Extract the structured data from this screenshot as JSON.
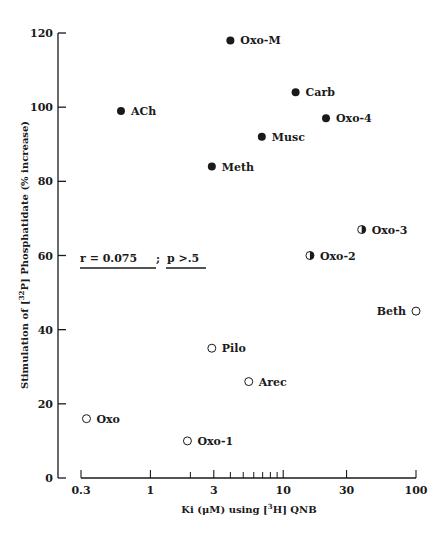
{
  "chart_data": {
    "type": "scatter",
    "title": "",
    "xlabel": "Ki (μM) using [3H] QNB",
    "ylabel": "Stimulation of [32P] Phosphatidate (% increase)",
    "x_scale": "log",
    "xlim": [
      0.3,
      100
    ],
    "ylim": [
      0,
      120
    ],
    "x_ticks": [
      0.3,
      1,
      3,
      10,
      30,
      100
    ],
    "x_tick_labels": [
      "0.3",
      "1",
      "3",
      "10",
      "30",
      "100"
    ],
    "x_minor_ticks": [
      2,
      4,
      5,
      6,
      7,
      8,
      9
    ],
    "y_ticks": [
      0,
      20,
      40,
      60,
      80,
      100,
      120
    ],
    "y_tick_labels": [
      "0",
      "20",
      "40",
      "60",
      "80",
      "100",
      "120"
    ],
    "grid": false,
    "legend": null,
    "annotation": {
      "text_left": "r = 0.075",
      "separator": ";",
      "text_right": "p >.5"
    },
    "marker_legend": {
      "filled": "full agonist",
      "half": "partial agonist",
      "open": "weak/partial agonist"
    },
    "points": [
      {
        "label": "Oxo-M",
        "x": 4.0,
        "y": 118,
        "marker": "filled",
        "label_side": "right"
      },
      {
        "label": "Carb",
        "x": 12.4,
        "y": 104,
        "marker": "filled",
        "label_side": "right"
      },
      {
        "label": "ACh",
        "x": 0.6,
        "y": 99,
        "marker": "filled",
        "label_side": "right"
      },
      {
        "label": "Oxo-4",
        "x": 21,
        "y": 97,
        "marker": "filled",
        "label_side": "right"
      },
      {
        "label": "Musc",
        "x": 6.9,
        "y": 92,
        "marker": "filled",
        "label_side": "right"
      },
      {
        "label": "Meth",
        "x": 2.9,
        "y": 84,
        "marker": "filled",
        "label_side": "right"
      },
      {
        "label": "Oxo-3",
        "x": 39,
        "y": 67,
        "marker": "half",
        "label_side": "right"
      },
      {
        "label": "Oxo-2",
        "x": 15.9,
        "y": 60,
        "marker": "half",
        "label_side": "right"
      },
      {
        "label": "Beth",
        "x": 100,
        "y": 45,
        "marker": "open",
        "label_side": "left"
      },
      {
        "label": "Pilo",
        "x": 2.9,
        "y": 35,
        "marker": "open",
        "label_side": "right"
      },
      {
        "label": "Arec",
        "x": 5.5,
        "y": 26,
        "marker": "open",
        "label_side": "right"
      },
      {
        "label": "Oxo",
        "x": 0.33,
        "y": 16,
        "marker": "open",
        "label_side": "right"
      },
      {
        "label": "Oxo-1",
        "x": 1.9,
        "y": 10,
        "marker": "open",
        "label_side": "right"
      }
    ]
  },
  "colors": {
    "ink": "#1a1a1a",
    "background": "#ffffff"
  }
}
